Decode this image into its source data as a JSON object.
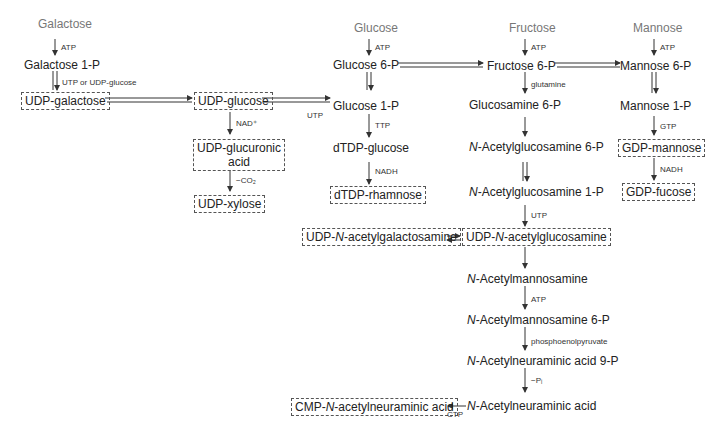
{
  "diagram": {
    "type": "metabolic-pathway",
    "sources": {
      "galactose": "Galactose",
      "glucose": "Glucose",
      "fructose": "Fructose",
      "mannose": "Mannose"
    },
    "nodes": {
      "galactose_1p": "Galactose 1-P",
      "udp_galactose": "UDP-galactose",
      "udp_glucose": "UDP-glucose",
      "udp_glucuronic_1": "UDP-glucuronic",
      "udp_glucuronic_2": "acid",
      "udp_xylose": "UDP-xylose",
      "glucose_6p": "Glucose 6-P",
      "glucose_1p": "Glucose 1-P",
      "dtdp_glucose": "dTDP-glucose",
      "dtdp_rhamnose": "dTDP-rhamnose",
      "fructose_6p": "Fructose 6-P",
      "glucosamine_6p": "Glucosamine 6-P",
      "nacglcn_6p_prefix": "N",
      "nacglcn_6p_rest": "-Acetylglucosamine 6-P",
      "nacglcn_1p_prefix": "N",
      "nacglcn_1p_rest": "-Acetylglucosamine 1-P",
      "udp_nacglcn_a": "UDP-",
      "udp_nacglcn_n": "N",
      "udp_nacglcn_b": "-acetylglucosamine",
      "udp_nacgal_a": "UDP-",
      "udp_nacgal_n": "N",
      "udp_nacgal_b": "-acetylgalactosamine",
      "nacman_prefix": "N",
      "nacman_rest": "-Acetylmannosamine",
      "nacman_6p_prefix": "N",
      "nacman_6p_rest": "-Acetylmannosamine 6-P",
      "nacneu_9p_prefix": "N",
      "nacneu_9p_rest": "-Acetylneuraminic acid 9-P",
      "nacneu_prefix": "N",
      "nacneu_rest": "-Acetylneuraminic acid",
      "cmp_nacneu_a": "CMP-",
      "cmp_nacneu_n": "N",
      "cmp_nacneu_b": "-acetylneuraminic acid",
      "mannose_6p": "Mannose 6-P",
      "mannose_1p": "Mannose 1-P",
      "gdp_mannose": "GDP-mannose",
      "gdp_fucose": "GDP-fucose"
    },
    "labels": {
      "gal_atp": "ATP",
      "gal_utp": "UTP or UDP-glucose",
      "nad": "NAD⁺",
      "co2": "−CO₂",
      "glc_atp": "ATP",
      "utp_glc1p": "UTP",
      "ttp": "TTP",
      "nadh_rham": "NADH",
      "fru_atp": "ATP",
      "glutamine": "glutamine",
      "utp_glcnac": "UTP",
      "man_atp": "ATP",
      "gtp": "GTP",
      "nadh_fuc": "NADH",
      "nacman_atp": "ATP",
      "pep": "phosphoenolpyruvate",
      "pi": "−Pᵢ",
      "ctp": "CTP"
    }
  }
}
